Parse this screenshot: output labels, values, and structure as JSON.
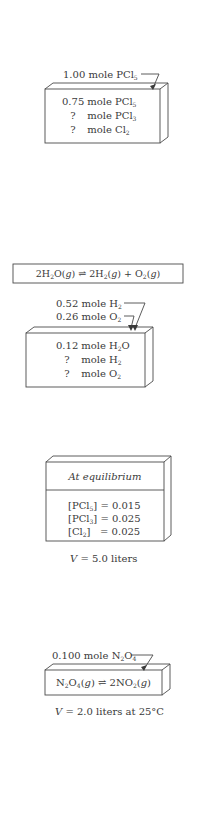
{
  "figures": [
    {
      "id": "pcl5-decomposition",
      "arrow_label": {
        "amount": "1.00 mole",
        "species": "PCl",
        "sub": "5"
      },
      "box_rows": [
        {
          "amount": "0.75",
          "unit": "mole",
          "species": "PCl",
          "sub": "5"
        },
        {
          "amount": "?",
          "unit": "mole",
          "species": "PCl",
          "sub": "3"
        },
        {
          "amount": "?",
          "unit": "mole",
          "species": "Cl",
          "sub": "2"
        }
      ]
    },
    {
      "id": "water-decomposition",
      "equation": {
        "lhs": "2H",
        "lhs_sub": "2",
        "lhs_rest": "O(",
        "lhs_g": "g",
        "lhs_close": ")",
        "arrow": "⇌",
        "rhs1": "2H",
        "rhs1_sub": "2",
        "rhs1_open": "(",
        "rhs1_g": "g",
        "rhs1_close": ")",
        "plus": "+",
        "rhs2": "O",
        "rhs2_sub": "2",
        "rhs2_open": "(",
        "rhs2_g": "g",
        "rhs2_close": ")"
      },
      "arrow_labels": [
        {
          "amount": "0.52 mole",
          "species": "H",
          "sub": "2"
        },
        {
          "amount": "0.26 mole",
          "species": "O",
          "sub": "2"
        }
      ],
      "box_rows": [
        {
          "amount": "0.12",
          "unit": "mole",
          "species": "H",
          "sub": "2",
          "tail": "O"
        },
        {
          "amount": "?",
          "unit": "mole",
          "species": "H",
          "sub": "2",
          "tail": ""
        },
        {
          "amount": "?",
          "unit": "mole",
          "species": "O",
          "sub": "2",
          "tail": ""
        }
      ]
    },
    {
      "id": "pcl5-equilibrium",
      "header": "At equilibrium",
      "rows": [
        {
          "open": "[PCl",
          "sub": "5",
          "close": "]",
          "eq": "= 0.015"
        },
        {
          "open": "[PCl",
          "sub": "3",
          "close": "]",
          "eq": "= 0.025"
        },
        {
          "open": "[Cl",
          "sub": "2",
          "close": "]",
          "eq": "= 0.025"
        }
      ],
      "caption": {
        "var": "V",
        "text": "= 5.0 liters"
      }
    },
    {
      "id": "n2o4-dissociation",
      "arrow_label": {
        "amount": "0.100 mole",
        "species": "N",
        "sub1": "2",
        "mid": "O",
        "sub2": "4"
      },
      "equation": {
        "a": "N",
        "a_sub": "2",
        "b": "O",
        "b_sub": "4",
        "c": "(",
        "g": "g",
        "d": ")",
        "arrow": "⇌",
        "e": "2NO",
        "e_sub": "2",
        "f": "(",
        "g2": "g",
        "h": ")"
      },
      "caption": {
        "var": "V",
        "text": "= 2.0 liters at 25°C"
      }
    }
  ],
  "colors": {
    "ink": "#3a3a3a",
    "line": "#4a4a4a",
    "background": "#ffffff"
  }
}
